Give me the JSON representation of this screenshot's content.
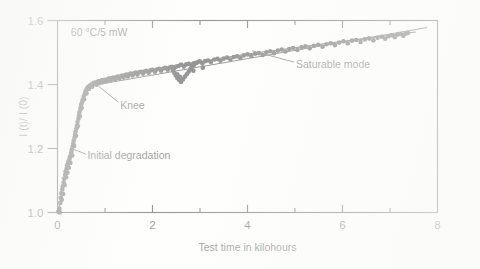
{
  "figure": {
    "background_color": "#fdfdfc",
    "ink_color": "#1a1a1a"
  },
  "chart_data": {
    "type": "scatter",
    "title": "",
    "xlabel": "Test time in kilohours",
    "ylabel": "I (t)/ I (0)",
    "xlim": [
      0,
      8
    ],
    "ylim": [
      1.0,
      1.6
    ],
    "grid": false,
    "legend_position": "none",
    "x_ticks_major": [
      0,
      2,
      4,
      6,
      8
    ],
    "x_tick_labels": [
      "0",
      "2",
      "4",
      "6",
      "8"
    ],
    "x_ticks_minor": [
      1,
      3,
      5,
      7
    ],
    "y_ticks_major": [
      1.0,
      1.2,
      1.4,
      1.6
    ],
    "y_tick_labels": [
      "1.0",
      "1.2",
      "1.4",
      "1.6"
    ],
    "marker": "filled-circle",
    "marker_color": "#141414",
    "marker_size_px": 4.6,
    "annotations": [
      {
        "name": "condition-label",
        "text": "60 °C/5 mW",
        "x": 0.28,
        "y": 1.565
      },
      {
        "name": "knee-label",
        "text": "Knee",
        "x": 1.32,
        "y": 1.335,
        "leader_from": [
          1.28,
          1.345
        ],
        "leader_to": [
          0.86,
          1.395
        ]
      },
      {
        "name": "initial-degradation-label",
        "text": "Initial degradation",
        "x": 0.63,
        "y": 1.178,
        "leader_from": [
          0.6,
          1.182
        ],
        "leader_to": [
          0.3,
          1.2
        ]
      },
      {
        "name": "saturable-mode-label",
        "text": "Saturable mode",
        "x": 5.02,
        "y": 1.462,
        "leader_from": [
          4.98,
          1.47
        ],
        "leader_to": [
          4.1,
          1.505
        ]
      }
    ],
    "fit_curve": [
      [
        0.02,
        1.003
      ],
      [
        0.06,
        1.04
      ],
      [
        0.1,
        1.075
      ],
      [
        0.14,
        1.105
      ],
      [
        0.18,
        1.13
      ],
      [
        0.22,
        1.152
      ],
      [
        0.26,
        1.172
      ],
      [
        0.3,
        1.196
      ],
      [
        0.34,
        1.222
      ],
      [
        0.38,
        1.252
      ],
      [
        0.42,
        1.282
      ],
      [
        0.46,
        1.312
      ],
      [
        0.5,
        1.338
      ],
      [
        0.55,
        1.362
      ],
      [
        0.6,
        1.38
      ],
      [
        0.66,
        1.392
      ],
      [
        0.72,
        1.399
      ],
      [
        0.8,
        1.404
      ],
      [
        0.9,
        1.409
      ],
      [
        1.0,
        1.413
      ],
      [
        1.2,
        1.421
      ],
      [
        1.4,
        1.428
      ],
      [
        1.6,
        1.435
      ],
      [
        1.8,
        1.441
      ],
      [
        2.0,
        1.447
      ],
      [
        2.2,
        1.452
      ],
      [
        2.4,
        1.457
      ],
      [
        2.6,
        1.462
      ],
      [
        2.8,
        1.467
      ],
      [
        3.0,
        1.472
      ],
      [
        3.3,
        1.479
      ],
      [
        3.6,
        1.486
      ],
      [
        4.0,
        1.495
      ],
      [
        4.4,
        1.503
      ],
      [
        4.8,
        1.511
      ],
      [
        5.2,
        1.519
      ],
      [
        5.6,
        1.527
      ],
      [
        6.0,
        1.535
      ],
      [
        6.4,
        1.542
      ],
      [
        6.8,
        1.55
      ],
      [
        7.2,
        1.558
      ],
      [
        7.55,
        1.564
      ]
    ],
    "points": [
      [
        0.02,
        1.002
      ],
      [
        0.03,
        1.006
      ],
      [
        0.04,
        1.012
      ],
      [
        0.05,
        1.0
      ],
      [
        0.06,
        1.03
      ],
      [
        0.07,
        1.046
      ],
      [
        0.08,
        1.06
      ],
      [
        0.09,
        1.04
      ],
      [
        0.1,
        1.072
      ],
      [
        0.11,
        1.082
      ],
      [
        0.12,
        1.058
      ],
      [
        0.13,
        1.094
      ],
      [
        0.14,
        1.106
      ],
      [
        0.15,
        1.086
      ],
      [
        0.16,
        1.118
      ],
      [
        0.17,
        1.128
      ],
      [
        0.18,
        1.11
      ],
      [
        0.19,
        1.136
      ],
      [
        0.2,
        1.146
      ],
      [
        0.21,
        1.124
      ],
      [
        0.22,
        1.152
      ],
      [
        0.23,
        1.16
      ],
      [
        0.24,
        1.14
      ],
      [
        0.25,
        1.166
      ],
      [
        0.26,
        1.173
      ],
      [
        0.27,
        1.155
      ],
      [
        0.28,
        1.18
      ],
      [
        0.29,
        1.188
      ],
      [
        0.3,
        1.197
      ],
      [
        0.31,
        1.178
      ],
      [
        0.32,
        1.206
      ],
      [
        0.33,
        1.215
      ],
      [
        0.34,
        1.224
      ],
      [
        0.35,
        1.208
      ],
      [
        0.36,
        1.234
      ],
      [
        0.37,
        1.244
      ],
      [
        0.38,
        1.253
      ],
      [
        0.39,
        1.24
      ],
      [
        0.4,
        1.263
      ],
      [
        0.41,
        1.272
      ],
      [
        0.42,
        1.283
      ],
      [
        0.43,
        1.27
      ],
      [
        0.44,
        1.293
      ],
      [
        0.45,
        1.302
      ],
      [
        0.46,
        1.312
      ],
      [
        0.47,
        1.3
      ],
      [
        0.48,
        1.321
      ],
      [
        0.49,
        1.329
      ],
      [
        0.5,
        1.338
      ],
      [
        0.51,
        1.327
      ],
      [
        0.52,
        1.345
      ],
      [
        0.53,
        1.352
      ],
      [
        0.55,
        1.362
      ],
      [
        0.56,
        1.354
      ],
      [
        0.57,
        1.368
      ],
      [
        0.58,
        1.374
      ],
      [
        0.6,
        1.381
      ],
      [
        0.61,
        1.372
      ],
      [
        0.62,
        1.386
      ],
      [
        0.63,
        1.39
      ],
      [
        0.65,
        1.393
      ],
      [
        0.66,
        1.386
      ],
      [
        0.68,
        1.396
      ],
      [
        0.7,
        1.398
      ],
      [
        0.72,
        1.401
      ],
      [
        0.73,
        1.393
      ],
      [
        0.75,
        1.403
      ],
      [
        0.77,
        1.405
      ],
      [
        0.8,
        1.406
      ],
      [
        0.82,
        1.399
      ],
      [
        0.84,
        1.408
      ],
      [
        0.86,
        1.41
      ],
      [
        0.88,
        1.404
      ],
      [
        0.9,
        1.411
      ],
      [
        0.93,
        1.413
      ],
      [
        0.95,
        1.407
      ],
      [
        0.97,
        1.414
      ],
      [
        1.0,
        1.415
      ],
      [
        1.03,
        1.41
      ],
      [
        1.06,
        1.417
      ],
      [
        1.09,
        1.419
      ],
      [
        1.12,
        1.413
      ],
      [
        1.15,
        1.42
      ],
      [
        1.18,
        1.422
      ],
      [
        1.21,
        1.416
      ],
      [
        1.24,
        1.423
      ],
      [
        1.27,
        1.425
      ],
      [
        1.3,
        1.419
      ],
      [
        1.33,
        1.426
      ],
      [
        1.36,
        1.428
      ],
      [
        1.39,
        1.422
      ],
      [
        1.42,
        1.429
      ],
      [
        1.45,
        1.431
      ],
      [
        1.48,
        1.425
      ],
      [
        1.51,
        1.432
      ],
      [
        1.54,
        1.434
      ],
      [
        1.58,
        1.428
      ],
      [
        1.61,
        1.435
      ],
      [
        1.65,
        1.437
      ],
      [
        1.68,
        1.431
      ],
      [
        1.72,
        1.438
      ],
      [
        1.76,
        1.44
      ],
      [
        1.8,
        1.434
      ],
      [
        1.84,
        1.441
      ],
      [
        1.88,
        1.443
      ],
      [
        1.92,
        1.437
      ],
      [
        1.96,
        1.444
      ],
      [
        2.0,
        1.446
      ],
      [
        2.05,
        1.44
      ],
      [
        2.09,
        1.447
      ],
      [
        2.14,
        1.449
      ],
      [
        2.18,
        1.443
      ],
      [
        2.23,
        1.45
      ],
      [
        2.27,
        1.452
      ],
      [
        2.32,
        1.446
      ],
      [
        2.36,
        1.453
      ],
      [
        2.41,
        1.455
      ],
      [
        2.45,
        1.449
      ],
      [
        2.5,
        1.456
      ],
      [
        2.55,
        1.458
      ],
      [
        2.6,
        1.462
      ],
      [
        2.66,
        1.456
      ],
      [
        2.71,
        1.463
      ],
      [
        2.76,
        1.465
      ],
      [
        2.82,
        1.459
      ],
      [
        2.87,
        1.466
      ],
      [
        2.93,
        1.468
      ],
      [
        2.98,
        1.472
      ],
      [
        3.05,
        1.466
      ],
      [
        3.11,
        1.473
      ],
      [
        3.17,
        1.475
      ],
      [
        3.23,
        1.47
      ],
      [
        3.3,
        1.478
      ],
      [
        3.37,
        1.48
      ],
      [
        3.43,
        1.474
      ],
      [
        3.5,
        1.481
      ],
      [
        3.57,
        1.484
      ],
      [
        3.64,
        1.478
      ],
      [
        3.71,
        1.486
      ],
      [
        3.78,
        1.488
      ],
      [
        3.85,
        1.483
      ],
      [
        3.92,
        1.491
      ],
      [
        4.0,
        1.494
      ],
      [
        4.08,
        1.489
      ],
      [
        4.16,
        1.496
      ],
      [
        4.24,
        1.498
      ],
      [
        4.32,
        1.492
      ],
      [
        4.4,
        1.501
      ],
      [
        4.48,
        1.504
      ],
      [
        4.56,
        1.498
      ],
      [
        4.64,
        1.506
      ],
      [
        4.72,
        1.509
      ],
      [
        4.8,
        1.503
      ],
      [
        4.88,
        1.511
      ],
      [
        4.96,
        1.514
      ],
      [
        5.05,
        1.508
      ],
      [
        5.14,
        1.516
      ],
      [
        5.22,
        1.519
      ],
      [
        5.31,
        1.513
      ],
      [
        5.4,
        1.521
      ],
      [
        5.49,
        1.524
      ],
      [
        5.58,
        1.518
      ],
      [
        5.66,
        1.526
      ],
      [
        5.75,
        1.529
      ],
      [
        5.84,
        1.523
      ],
      [
        5.93,
        1.531
      ],
      [
        6.02,
        1.535
      ],
      [
        6.11,
        1.529
      ],
      [
        6.2,
        1.537
      ],
      [
        6.29,
        1.539
      ],
      [
        6.38,
        1.533
      ],
      [
        6.47,
        1.541
      ],
      [
        6.56,
        1.544
      ],
      [
        6.65,
        1.538
      ],
      [
        6.74,
        1.546
      ],
      [
        6.83,
        1.549
      ],
      [
        6.9,
        1.543
      ],
      [
        6.97,
        1.551
      ],
      [
        7.04,
        1.554
      ],
      [
        7.1,
        1.548
      ],
      [
        7.16,
        1.556
      ],
      [
        7.22,
        1.558
      ],
      [
        7.28,
        1.552
      ],
      [
        7.33,
        1.559
      ],
      [
        7.38,
        1.561
      ]
    ],
    "outlier_branch_points": [
      [
        2.4,
        1.453
      ],
      [
        2.43,
        1.444
      ],
      [
        2.46,
        1.436
      ],
      [
        2.49,
        1.428
      ],
      [
        2.52,
        1.42
      ],
      [
        2.56,
        1.414
      ],
      [
        2.6,
        1.408
      ],
      [
        2.52,
        1.432
      ],
      [
        2.58,
        1.424
      ],
      [
        2.64,
        1.416
      ],
      [
        2.68,
        1.424
      ],
      [
        2.72,
        1.432
      ],
      [
        2.76,
        1.44
      ],
      [
        2.8,
        1.448
      ],
      [
        2.84,
        1.456
      ],
      [
        2.88,
        1.462
      ],
      [
        2.92,
        1.468
      ],
      [
        3.0,
        1.472
      ],
      [
        2.86,
        1.443
      ],
      [
        3.06,
        1.452
      ]
    ],
    "branch_curve": [
      [
        2.4,
        1.456
      ],
      [
        2.47,
        1.436
      ],
      [
        2.54,
        1.42
      ],
      [
        2.62,
        1.41
      ],
      [
        2.7,
        1.424
      ],
      [
        2.8,
        1.446
      ],
      [
        2.9,
        1.464
      ],
      [
        3.0,
        1.474
      ]
    ]
  }
}
